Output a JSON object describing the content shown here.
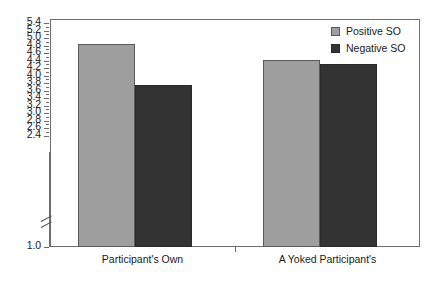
{
  "chart_data": {
    "type": "bar",
    "title": "",
    "subtitle": "",
    "xlabel": "",
    "ylabel": "",
    "categories": [
      "Participant's Own",
      "A Yoked Participant's"
    ],
    "series": [
      {
        "name": "Positive SO",
        "color": "#9e9e9e",
        "values": [
          4.83,
          4.42
        ]
      },
      {
        "name": "Negative SO",
        "color": "#333333",
        "values": [
          3.75,
          4.3
        ]
      }
    ],
    "ylim": [
      1.0,
      5.4
    ],
    "y_axis_break": {
      "between": [
        1.0,
        2.4
      ],
      "present": true
    },
    "y_ticks": [
      5.4,
      5.2,
      5.0,
      4.8,
      4.6,
      4.4,
      4.2,
      4.0,
      3.8,
      3.6,
      3.4,
      3.2,
      3.0,
      2.8,
      2.6,
      2.4,
      1.0
    ],
    "y_tick_labels": [
      "5.4",
      "5.2",
      "5.0",
      "4.8",
      "4.6",
      "4.4",
      "4.2",
      "4.0",
      "3.8",
      "3.6",
      "3.4",
      "3.2",
      "3.0",
      "2.8",
      "2.6",
      "2.4",
      "1.0"
    ],
    "grid": false,
    "legend_position": "top-right",
    "legend": [
      "Positive SO",
      "Negative SO"
    ]
  }
}
